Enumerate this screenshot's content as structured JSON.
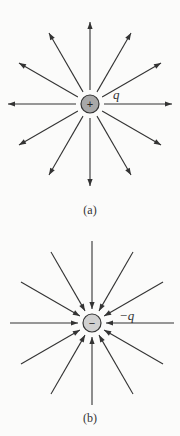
{
  "diagrams": [
    {
      "id": "a",
      "caption": "(a)",
      "charge_label": "q",
      "charge_sign": "+",
      "direction": "outward",
      "center": [
        90,
        104
      ],
      "inner_radius": 12,
      "outer_radius": 82,
      "line_count": 12,
      "charge_fill": "#a8a8a8"
    },
    {
      "id": "b",
      "caption": "(b)",
      "charge_label": "−q",
      "charge_sign": "−",
      "direction": "inward",
      "center": [
        92,
        323
      ],
      "inner_radius": 12,
      "outer_radius": 82,
      "line_count": 12,
      "charge_fill": "#d0d0d0"
    }
  ],
  "colors": {
    "line": "#333333",
    "background": "#fbfbfa"
  }
}
